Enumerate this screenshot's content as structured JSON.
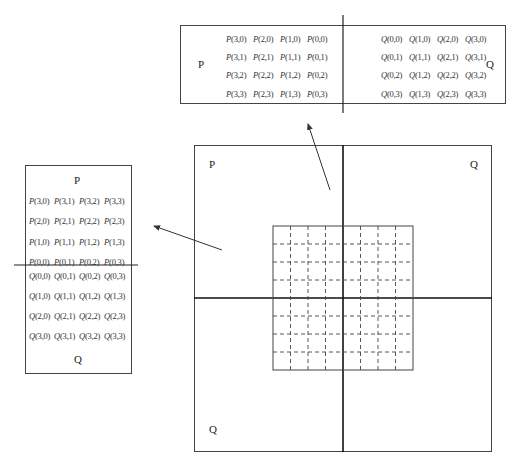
{
  "title": "",
  "top_panel": {
    "left_label": "P",
    "right_label": "Q",
    "p_rows": [
      [
        "P(3,0)",
        "P(2,0)",
        "P(1,0)",
        "P(0,0)"
      ],
      [
        "P(3,1)",
        "P(2,1)",
        "P(1,1)",
        "P(0,1)"
      ],
      [
        "P(3,2)",
        "P(2,2)",
        "P(1,2)",
        "P(0,2)"
      ],
      [
        "P(3,3)",
        "P(2,3)",
        "P(1,3)",
        "P(0,3)"
      ]
    ],
    "q_rows": [
      [
        "Q(0,0)",
        "Q(1,0)",
        "Q(2,0)",
        "Q(3,0)"
      ],
      [
        "Q(0,1)",
        "Q(1,1)",
        "Q(2,1)",
        "Q(3,1)"
      ],
      [
        "Q(0,2)",
        "Q(1,2)",
        "Q(2,2)",
        "Q(3,2)"
      ],
      [
        "Q(0,3)",
        "Q(1,3)",
        "Q(2,3)",
        "Q(3,3)"
      ]
    ]
  },
  "left_panel": {
    "top_label": "P",
    "bottom_label": "Q",
    "p_rows": [
      [
        "P(3,0)",
        "P(3,1)",
        "P(3,2)",
        "P(3,3)"
      ],
      [
        "P(2,0)",
        "P(2,1)",
        "P(2,2)",
        "P(2,3)"
      ],
      [
        "P(1,0)",
        "P(1,1)",
        "P(1,2)",
        "P(1,3)"
      ],
      [
        "P(0,0)",
        "P(0,1)",
        "P(0,2)",
        "P(0,3)"
      ]
    ],
    "q_rows": [
      [
        "Q(0,0)",
        "Q(0,1)",
        "Q(0,2)",
        "Q(0,3)"
      ],
      [
        "Q(1,0)",
        "Q(1,1)",
        "Q(1,2)",
        "Q(1,3)"
      ],
      [
        "Q(2,0)",
        "Q(2,1)",
        "Q(2,2)",
        "Q(2,3)"
      ],
      [
        "Q(3,0)",
        "Q(3,1)",
        "Q(3,2)",
        "Q(3,3)"
      ]
    ]
  },
  "main_panel": {
    "top_left_label": "P",
    "top_right_label": "Q",
    "bottom_left_label": "Q",
    "grid": {
      "rows": 8,
      "cols": 8,
      "line_style": "dashed"
    }
  },
  "colors": {
    "line": "#333333",
    "axis": "#111111",
    "text": "#222222"
  }
}
